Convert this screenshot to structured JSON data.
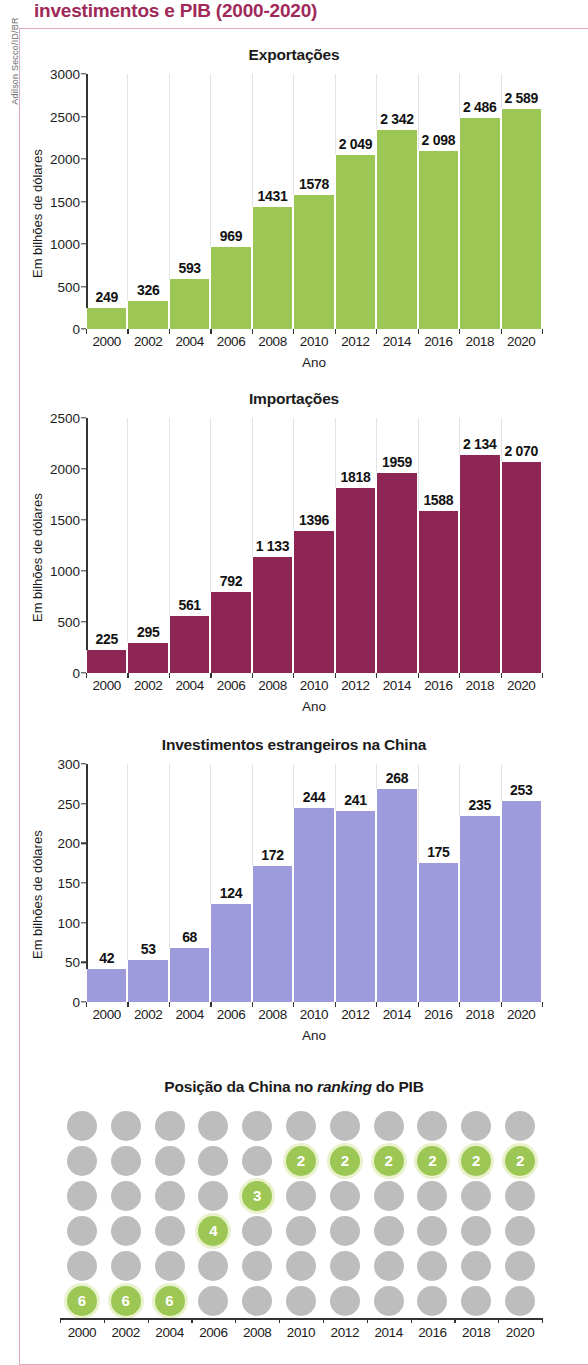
{
  "document": {
    "title": "investimentos e PIB (2000-2020)",
    "credit": "Adilson Secco/ID/BR",
    "title_color": "#A0295A"
  },
  "axis": {
    "ylabel": "Em bilhões de dólares",
    "xlabel": "Ano"
  },
  "chart_data": [
    {
      "type": "bar",
      "title": "Exportações",
      "xlabel": "Ano",
      "ylabel": "Em bilhões de dólares",
      "ylim": [
        0,
        3000
      ],
      "yticks": [
        "0",
        "500",
        "1000",
        "1500",
        "2000",
        "2500",
        "3000"
      ],
      "ytick_values": [
        0,
        500,
        1000,
        1500,
        2000,
        2500,
        3000
      ],
      "grid": true,
      "color": "#9DC755",
      "categories": [
        "2000",
        "2002",
        "2004",
        "2006",
        "2008",
        "2010",
        "2012",
        "2014",
        "2016",
        "2018",
        "2020"
      ],
      "values": [
        249,
        326,
        593,
        969,
        1431,
        1578,
        2049,
        2342,
        2098,
        2486,
        2589
      ],
      "labels": [
        "249",
        "326",
        "593",
        "969",
        "1431",
        "1578",
        "2 049",
        "2 342",
        "2 098",
        "2 486",
        "2 589"
      ]
    },
    {
      "type": "bar",
      "title": "Importações",
      "xlabel": "Ano",
      "ylabel": "Em bilhões de dólares",
      "ylim": [
        0,
        2500
      ],
      "yticks": [
        "0",
        "500",
        "1000",
        "1500",
        "2000",
        "2500"
      ],
      "ytick_values": [
        0,
        500,
        1000,
        1500,
        2000,
        2500
      ],
      "grid": true,
      "color": "#8D2655",
      "categories": [
        "2000",
        "2002",
        "2004",
        "2006",
        "2008",
        "2010",
        "2012",
        "2014",
        "2016",
        "2018",
        "2020"
      ],
      "values": [
        225,
        295,
        561,
        792,
        1133,
        1396,
        1818,
        1959,
        1588,
        2134,
        2070
      ],
      "labels": [
        "225",
        "295",
        "561",
        "792",
        "1 133",
        "1396",
        "1818",
        "1959",
        "1588",
        "2 134",
        "2 070"
      ]
    },
    {
      "type": "bar",
      "title": "Investimentos estrangeiros na China",
      "xlabel": "Ano",
      "ylabel": "Em bilhões de dólares",
      "ylim": [
        0,
        300
      ],
      "yticks": [
        "0",
        "50",
        "100",
        "150",
        "200",
        "250",
        "300"
      ],
      "ytick_values": [
        0,
        50,
        100,
        150,
        200,
        250,
        300
      ],
      "grid": true,
      "color": "#9D9BDC",
      "categories": [
        "2000",
        "2002",
        "2004",
        "2006",
        "2008",
        "2010",
        "2012",
        "2014",
        "2016",
        "2018",
        "2020"
      ],
      "values": [
        42,
        53,
        68,
        124,
        172,
        244,
        241,
        268,
        175,
        235,
        253
      ],
      "labels": [
        "42",
        "53",
        "68",
        "124",
        "172",
        "244",
        "241",
        "268",
        "175",
        "235",
        "253"
      ]
    },
    {
      "type": "scatter",
      "title_parts": [
        "Posição da China no ",
        "ranking",
        " do PIB"
      ],
      "title": "Posição da China no ranking do PIB",
      "xlabel": "",
      "ylabel": "",
      "rows": [
        1,
        2,
        3,
        4,
        5,
        6
      ],
      "categories": [
        "2000",
        "2002",
        "2004",
        "2006",
        "2008",
        "2010",
        "2012",
        "2014",
        "2016",
        "2018",
        "2020"
      ],
      "values": [
        6,
        6,
        6,
        4,
        3,
        2,
        2,
        2,
        2,
        2,
        2
      ],
      "highlight_color": "#9DC755",
      "dot_color": "#BDBDBD"
    }
  ]
}
